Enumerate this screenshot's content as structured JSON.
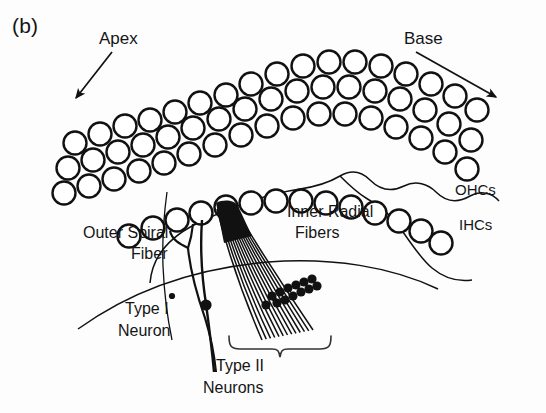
{
  "figure": {
    "panel_letter": "(b)",
    "caption_labels": {
      "apex": "Apex",
      "base": "Base",
      "ohcs": "OHCs",
      "ihcs": "IHCs",
      "inner_radial_fibers_line1": "Inner Radial",
      "inner_radial_fibers_line2": "Fibers",
      "outer_spiral_fiber_line1": "Outer Spiral",
      "outer_spiral_fiber_line2": "Fiber",
      "type_i_neuron_line1": "Type I",
      "type_i_neuron_line2": "Neuron",
      "type_ii_neurons_line1": "Type II",
      "type_ii_neurons_line2": "Neurons"
    },
    "colors": {
      "background": "#fdfdfd",
      "stroke": "#111111",
      "text": "#151515",
      "cell_fill": "#ffffff"
    },
    "geometry": {
      "width": 546,
      "height": 413,
      "cell_radius_ohc": 11.5,
      "cell_radius_ihc": 11.5,
      "ohc_row_count": 3,
      "ihc_row_count": 1
    },
    "ohc_rows": [
      {
        "row": 1,
        "cells": [
          [
            75,
            143
          ],
          [
            100,
            134
          ],
          [
            125,
            126
          ],
          [
            150,
            120
          ],
          [
            175,
            112
          ],
          [
            200,
            103
          ],
          [
            226,
            95
          ],
          [
            251,
            84
          ],
          [
            277,
            74
          ],
          [
            303,
            66
          ],
          [
            329,
            62
          ],
          [
            355,
            62
          ],
          [
            381,
            66
          ],
          [
            406,
            74
          ],
          [
            431,
            84
          ],
          [
            455,
            96
          ],
          [
            477,
            110
          ]
        ]
      },
      {
        "row": 2,
        "cells": [
          [
            68,
            168
          ],
          [
            93,
            160
          ],
          [
            118,
            152
          ],
          [
            143,
            145
          ],
          [
            168,
            137
          ],
          [
            193,
            128
          ],
          [
            219,
            119
          ],
          [
            245,
            109
          ],
          [
            271,
            99
          ],
          [
            297,
            91
          ],
          [
            323,
            87
          ],
          [
            349,
            87
          ],
          [
            375,
            91
          ],
          [
            400,
            99
          ],
          [
            425,
            110
          ],
          [
            449,
            124
          ],
          [
            471,
            140
          ]
        ]
      },
      {
        "row": 3,
        "cells": [
          [
            64,
            193
          ],
          [
            89,
            186
          ],
          [
            114,
            179
          ],
          [
            139,
            171
          ],
          [
            164,
            163
          ],
          [
            189,
            154
          ],
          [
            215,
            145
          ],
          [
            241,
            135
          ],
          [
            267,
            126
          ],
          [
            293,
            118
          ],
          [
            319,
            114
          ],
          [
            345,
            114
          ],
          [
            371,
            118
          ],
          [
            396,
            127
          ],
          [
            421,
            138
          ],
          [
            445,
            152
          ],
          [
            467,
            169
          ]
        ]
      }
    ],
    "ihc_row": {
      "cells": [
        [
          129,
          236
        ],
        [
          153,
          228
        ],
        [
          177,
          220
        ],
        [
          201,
          213
        ],
        [
          226,
          207
        ],
        [
          251,
          203
        ],
        [
          276,
          201
        ],
        [
          301,
          201
        ],
        [
          326,
          203
        ],
        [
          351,
          207
        ],
        [
          375,
          213
        ],
        [
          399,
          221
        ],
        [
          421,
          231
        ],
        [
          441,
          243
        ]
      ]
    },
    "inner_radial_fibers": {
      "origin_cell": [
        226,
        207
      ],
      "fiber_count": 13,
      "fan_bottom_left": [
        262,
        340
      ],
      "fan_bottom_right": [
        313,
        330
      ]
    },
    "type_ii_synapse_dots": [
      [
        272,
        296
      ],
      [
        280,
        292
      ],
      [
        288,
        288
      ],
      [
        296,
        285
      ],
      [
        304,
        282
      ],
      [
        312,
        279
      ],
      [
        277,
        303
      ],
      [
        285,
        300
      ],
      [
        293,
        296
      ],
      [
        301,
        292
      ],
      [
        309,
        289
      ],
      [
        317,
        286
      ],
      [
        266,
        305
      ]
    ],
    "type_i_neuron": {
      "soma_dot": [
        207,
        305
      ],
      "small_dot": [
        172,
        296
      ],
      "fiber_top": [
        191,
        212
      ],
      "fiber_bottom": [
        213,
        370
      ]
    },
    "outer_spiral_fiber": {
      "junction": [
        188,
        247
      ],
      "branch_cells": [
        [
          170,
          219
        ],
        [
          193,
          212
        ]
      ]
    },
    "bracket_type_ii": {
      "left": 228,
      "right": 330,
      "top": 338,
      "center": 279
    },
    "arrows": {
      "apex": {
        "from": [
          110,
          52
        ],
        "to": [
          73,
          102
        ]
      },
      "base": {
        "from": [
          415,
          52
        ],
        "to": [
          500,
          100
        ]
      }
    }
  }
}
